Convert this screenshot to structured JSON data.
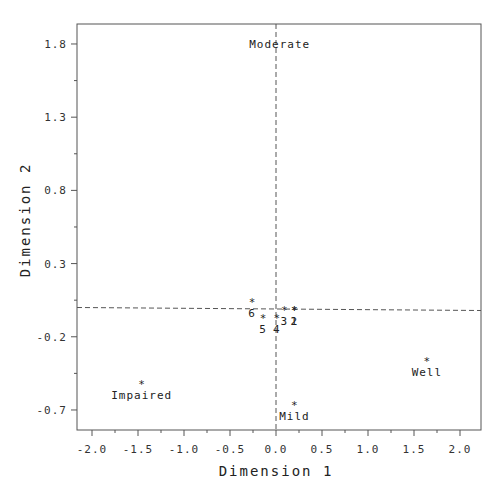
{
  "chart_data": {
    "type": "scatter",
    "title": "",
    "xlabel": "Dimension 1",
    "ylabel": "Dimension 2",
    "xlim": [
      -2.17,
      2.17
    ],
    "ylim": [
      -0.82,
      2.0
    ],
    "grid": false,
    "reference_lines": {
      "x": 0.0,
      "y": 0.0,
      "style": "dashed"
    },
    "x_ticks": [
      "-2.0",
      "-1.5",
      "-1.0",
      "-0.5",
      "0.0",
      "0.5",
      "1.0",
      "1.5",
      "2.0"
    ],
    "y_ticks": [
      "1.8",
      "1.3",
      "0.8",
      "0.3",
      "-0.2",
      "-0.7"
    ],
    "marker": "*",
    "points": [
      {
        "label": "Moderate",
        "x": 0.04,
        "y": 1.8,
        "label_pos": "center"
      },
      {
        "label": "Impaired",
        "x": -1.46,
        "y": -0.51,
        "label_pos": "below"
      },
      {
        "label": "Mild",
        "x": 0.2,
        "y": -0.65,
        "label_pos": "below"
      },
      {
        "label": "Well",
        "x": 1.64,
        "y": -0.35,
        "label_pos": "below"
      },
      {
        "label": "6",
        "x": -0.26,
        "y": 0.05,
        "label_pos": "below"
      },
      {
        "label": "5",
        "x": -0.14,
        "y": -0.06,
        "label_pos": "below"
      },
      {
        "label": "4",
        "x": 0.01,
        "y": -0.06,
        "label_pos": "below"
      },
      {
        "label": "3",
        "x": 0.09,
        "y": 0.0,
        "label_pos": "below"
      },
      {
        "label": "1",
        "x": 0.2,
        "y": 0.0,
        "label_pos": "below"
      },
      {
        "label": "2",
        "x": 0.2,
        "y": 0.0,
        "label_pos": "below"
      }
    ]
  }
}
